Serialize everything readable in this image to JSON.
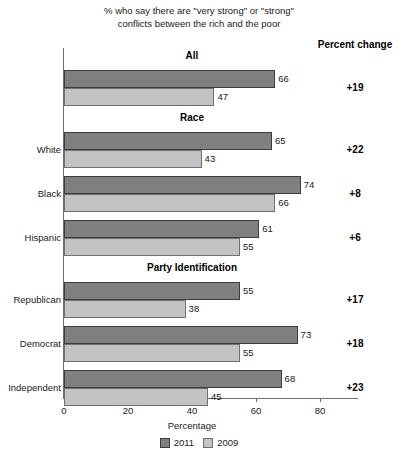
{
  "chart_data": {
    "type": "bar",
    "orientation": "horizontal",
    "title": "% who say there are \"very strong\" or \"strong\" conflicts between the rich and the poor",
    "title_line1": "% who say there are \"very strong\" or \"strong\"",
    "title_line2": "conflicts between the rich and the poor",
    "xlabel": "Percentage",
    "ylabel": "",
    "xlim": [
      0,
      80
    ],
    "xticks": [
      0,
      20,
      40,
      60,
      80
    ],
    "xtick_labels": [
      "0",
      "20",
      "40",
      "60",
      "80"
    ],
    "grid": false,
    "legend_position": "bottom",
    "series": [
      {
        "name": "2011",
        "color": "#808080"
      },
      {
        "name": "2009",
        "color": "#c3c3c3"
      }
    ],
    "extra_column_header": "Percent change",
    "groups": [
      {
        "heading": "All",
        "rows": [
          {
            "category": "",
            "values": {
              "2011": 66,
              "2009": 47
            },
            "labels": {
              "2011": "66",
              "2009": "47"
            },
            "percent_change": "+19"
          }
        ]
      },
      {
        "heading": "Race",
        "rows": [
          {
            "category": "White",
            "values": {
              "2011": 65,
              "2009": 43
            },
            "labels": {
              "2011": "65",
              "2009": "43"
            },
            "percent_change": "+22"
          },
          {
            "category": "Black",
            "values": {
              "2011": 74,
              "2009": 66
            },
            "labels": {
              "2011": "74",
              "2009": "66"
            },
            "percent_change": "+8"
          },
          {
            "category": "Hispanic",
            "values": {
              "2011": 61,
              "2009": 55
            },
            "labels": {
              "2011": "61",
              "2009": "55"
            },
            "percent_change": "+6"
          }
        ]
      },
      {
        "heading": "Party Identification",
        "rows": [
          {
            "category": "Republican",
            "values": {
              "2011": 55,
              "2009": 38
            },
            "labels": {
              "2011": "55",
              "2009": "38"
            },
            "percent_change": "+17"
          },
          {
            "category": "Democrat",
            "values": {
              "2011": 73,
              "2009": 55
            },
            "labels": {
              "2011": "73",
              "2009": "55"
            },
            "percent_change": "+18"
          },
          {
            "category": "Independent",
            "values": {
              "2011": 68,
              "2009": 45
            },
            "labels": {
              "2011": "68",
              "2009": "45"
            },
            "percent_change": "+23"
          }
        ]
      }
    ]
  }
}
